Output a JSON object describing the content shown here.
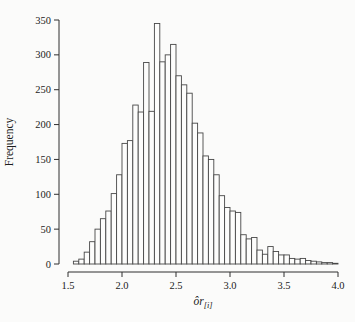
{
  "page": {
    "background": "#fbfbfa"
  },
  "chart_data": {
    "type": "bar",
    "subtype": "histogram",
    "title": "",
    "xlabel": {
      "main": "ôr",
      "subscript": "[i]"
    },
    "ylabel": "Frequency",
    "legend_position": "none",
    "grid": false,
    "xlim": [
      1.5,
      4.0
    ],
    "ylim": [
      0,
      350
    ],
    "bin_start": 1.55,
    "bin_width": 0.05,
    "values": [
      4,
      7,
      17,
      32,
      50,
      65,
      76,
      101,
      128,
      173,
      177,
      228,
      218,
      289,
      219,
      345,
      290,
      300,
      315,
      270,
      257,
      245,
      202,
      188,
      155,
      150,
      128,
      98,
      81,
      76,
      74,
      42,
      36,
      38,
      20,
      14,
      25,
      18,
      13,
      13,
      8,
      7,
      8,
      5,
      4,
      3,
      2,
      2,
      1
    ],
    "x_tick_values": [
      1.5,
      2.0,
      2.5,
      3.0,
      3.5,
      4.0
    ],
    "x_tick_labels": [
      "1.5",
      "2.0",
      "2.5",
      "3.0",
      "3.5",
      "4.0"
    ],
    "y_tick_values": [
      0,
      50,
      100,
      150,
      200,
      250,
      300,
      350
    ],
    "y_tick_labels": [
      "0",
      "50",
      "100",
      "150",
      "200",
      "250",
      "300",
      "350"
    ],
    "colors": {
      "bar_fill": "#fdfdfc",
      "bar_stroke": "#474747",
      "axis": "#2e2e2e",
      "text": "#1c1c1c"
    }
  }
}
